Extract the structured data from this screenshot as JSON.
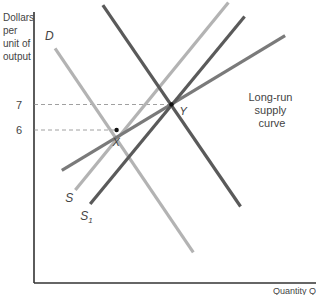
{
  "chart_data": {
    "type": "line",
    "title": "",
    "ylabel_lines": [
      "Dollars",
      "per",
      "unit of",
      "output"
    ],
    "xlabel": "Quantity Q",
    "yticks": [
      {
        "value": 6,
        "label": "6"
      },
      {
        "value": 7,
        "label": "7"
      }
    ],
    "ylim": [
      0,
      10.6
    ],
    "xlim": [
      0,
      10
    ],
    "grid": false,
    "series": [
      {
        "name": "D",
        "label": "D",
        "subscript": "",
        "kind": "demand",
        "color": "#b3b3b3",
        "points": [
          [
            0.78,
            9.2
          ],
          [
            5.9,
            1.2
          ]
        ]
      },
      {
        "name": "D1",
        "label": "D",
        "subscript": "1",
        "kind": "demand",
        "color": "#5a5a5a",
        "points": [
          [
            2.55,
            10.9
          ],
          [
            7.65,
            3.0
          ]
        ]
      },
      {
        "name": "S",
        "label": "S",
        "subscript": "",
        "kind": "supply",
        "color": "#b3b3b3",
        "points": [
          [
            1.53,
            3.65
          ],
          [
            7.2,
            11.0
          ]
        ]
      },
      {
        "name": "S1",
        "label": "S",
        "subscript": "1",
        "kind": "supply",
        "color": "#5a5a5a",
        "points": [
          [
            2.08,
            3.1
          ],
          [
            7.8,
            10.45
          ]
        ]
      },
      {
        "name": "Long-run supply curve",
        "label": "Long-run supply curve",
        "kind": "long-run-supply",
        "color": "#7a7a7a",
        "points": [
          [
            1.03,
            4.42
          ],
          [
            9.3,
            9.7
          ]
        ]
      }
    ],
    "annotations": [
      {
        "label": "X",
        "x": 3.06,
        "y": 6,
        "note": "initial equilibrium"
      },
      {
        "label": "Y",
        "x": 5.09,
        "y": 7,
        "note": "new long-run equilibrium"
      }
    ],
    "long_run_label_lines": [
      "Long-run",
      "supply",
      "curve"
    ]
  }
}
